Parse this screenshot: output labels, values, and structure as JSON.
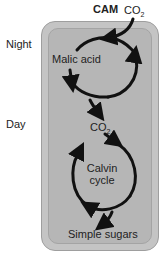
{
  "title": "CAM",
  "co2_top": {
    "base": "CO",
    "sub": "2"
  },
  "co2_mid": {
    "base": "CO",
    "sub": "2"
  },
  "side_labels": {
    "night": "Night",
    "day": "Day"
  },
  "labels": {
    "malic_acid": "Malic acid",
    "calvin_line1": "Calvin",
    "calvin_line2": "cycle",
    "simple_sugars": "Simple sugars"
  },
  "colors": {
    "cell_outer": "#c4c4c4",
    "cell_inner": "#b6b6b6",
    "arrow": "#111111"
  }
}
